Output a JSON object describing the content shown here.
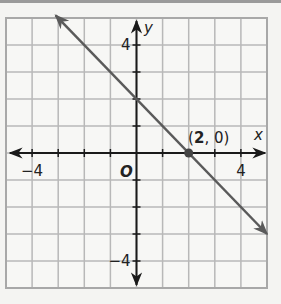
{
  "chart_data": {
    "type": "line",
    "title": "",
    "xlabel": "x",
    "ylabel": "y",
    "origin_label": "O",
    "xlim": [
      -5,
      5
    ],
    "ylim": [
      -5,
      5
    ],
    "grid": true,
    "x_tick_labels": [
      {
        "value": -4,
        "label": "−4"
      },
      {
        "value": 4,
        "label": "4"
      }
    ],
    "y_tick_labels": [
      {
        "value": 4,
        "label": "4"
      },
      {
        "value": -4,
        "label": "−4"
      }
    ],
    "series": [
      {
        "name": "line",
        "slope": -1,
        "intercept": 2,
        "x": [
          -3.1,
          5
        ],
        "y": [
          5.1,
          -3
        ],
        "arrows": "both",
        "color": "#5a5a5a"
      }
    ],
    "points": [
      {
        "x": 2,
        "y": 0,
        "label": "(2, 0)",
        "label_bold_part": "2"
      }
    ],
    "colors": {
      "grid": "#b8b8b8",
      "frame": "#a8a8a8",
      "axis": "#1a1a1a",
      "line": "#5a5a5a",
      "background": "#f7f7f5"
    }
  }
}
